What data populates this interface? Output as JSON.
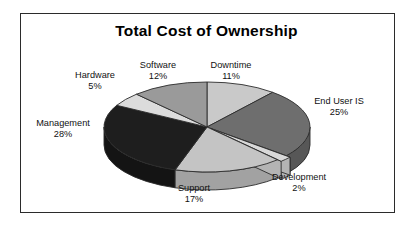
{
  "figure": {
    "title": "Total Cost of Ownership",
    "background_color": "#ffffff",
    "border_color": "#2b2b2b",
    "text_color": "#111111"
  },
  "chart_data": {
    "type": "pie",
    "title": "Total Cost of Ownership",
    "xlabel": "",
    "ylabel": "",
    "legend_position": "none",
    "grid": false,
    "three_d": true,
    "units": "percent",
    "total": 100,
    "categories": [
      "Downtime",
      "End User IS",
      "Development",
      "Support",
      "Management",
      "Hardware",
      "Software"
    ],
    "values": [
      11,
      25,
      2,
      17,
      28,
      5,
      12
    ],
    "labels": [
      "Downtime\n11%",
      "End User IS\n25%",
      "Development\n2%",
      "Support\n17%",
      "Management\n28%",
      "Hardware\n5%",
      "Software\n12%"
    ],
    "colors": [
      "#c9c9c9",
      "#6e6e6e",
      "#d8d8d8",
      "#c4c4c4",
      "#1e1e1e",
      "#dcdcdc",
      "#9a9a9a"
    ],
    "slices": [
      {
        "name": "Downtime",
        "percent": 11,
        "percent_label": "11%",
        "color": "#c9c9c9",
        "side_color": "#a7a7a7"
      },
      {
        "name": "End User IS",
        "percent": 25,
        "percent_label": "25%",
        "color": "#6e6e6e",
        "side_color": "#575757"
      },
      {
        "name": "Development",
        "percent": 2,
        "percent_label": "2%",
        "color": "#d8d8d8",
        "side_color": "#b4b4b4"
      },
      {
        "name": "Support",
        "percent": 17,
        "percent_label": "17%",
        "color": "#c4c4c4",
        "side_color": "#a2a2a2"
      },
      {
        "name": "Management",
        "percent": 28,
        "percent_label": "28%",
        "color": "#1e1e1e",
        "side_color": "#141414"
      },
      {
        "name": "Hardware",
        "percent": 5,
        "percent_label": "5%",
        "color": "#dcdcdc",
        "side_color": "#b8b8b8"
      },
      {
        "name": "Software",
        "percent": 12,
        "percent_label": "12%",
        "color": "#9a9a9a",
        "side_color": "#7d7d7d"
      }
    ]
  },
  "labels": {
    "hardware": {
      "name": "Hardware",
      "percent": "5%"
    },
    "software": {
      "name": "Software",
      "percent": "12%"
    },
    "downtime": {
      "name": "Downtime",
      "percent": "11%"
    },
    "end_user_is": {
      "name": "End User IS",
      "percent": "25%"
    },
    "development": {
      "name": "Development",
      "percent": "2%"
    },
    "support": {
      "name": "Support",
      "percent": "17%"
    },
    "management": {
      "name": "Management",
      "percent": "28%"
    }
  }
}
